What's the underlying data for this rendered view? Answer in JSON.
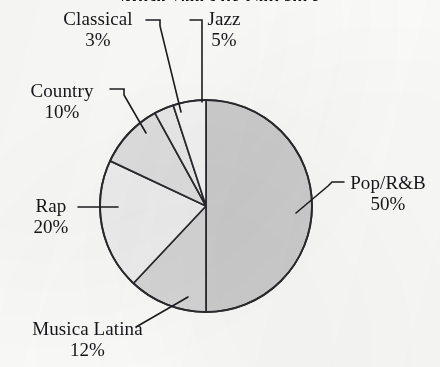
{
  "figure": {
    "title": "Music Sales by Category",
    "title_note": "clipped at top edge of image"
  },
  "chart_data": {
    "type": "pie",
    "title": "Music Sales by Category",
    "xlabel": "",
    "ylabel": "",
    "units": "percent",
    "start_angle_deg": 90,
    "direction": "clockwise",
    "categories": [
      "Pop/R&B",
      "Musica Latina",
      "Rap",
      "Country",
      "Classical",
      "Jazz"
    ],
    "values": [
      50,
      12,
      20,
      10,
      3,
      5
    ],
    "labels": [
      "50%",
      "12%",
      "20%",
      "10%",
      "3%",
      "5%"
    ],
    "slice_colors": [
      "#cfcfcf",
      "#d8d8d8",
      "#f2f2f2",
      "#e2e2e2",
      "#ededed",
      "#f7f7f7"
    ],
    "stroke_color": "#2a2a2e",
    "legend": "none",
    "grid": false,
    "slices": [
      {
        "name": "Pop/R&B",
        "value": 50,
        "label": "50%",
        "color": "#cfcfcf",
        "start_deg": 0,
        "end_deg": 180
      },
      {
        "name": "Musica Latina",
        "value": 12,
        "label": "12%",
        "color": "#d8d8d8",
        "start_deg": 180,
        "end_deg": 223.2
      },
      {
        "name": "Rap",
        "value": 20,
        "label": "20%",
        "color": "#f2f2f2",
        "start_deg": 223.2,
        "end_deg": 295.2
      },
      {
        "name": "Country",
        "value": 10,
        "label": "10%",
        "color": "#e2e2e2",
        "start_deg": 295.2,
        "end_deg": 331.2
      },
      {
        "name": "Classical",
        "value": 3,
        "label": "3%",
        "color": "#ededed",
        "start_deg": 331.2,
        "end_deg": 342.0
      },
      {
        "name": "Jazz",
        "value": 5,
        "label": "5%",
        "color": "#f7f7f7",
        "start_deg": 342.0,
        "end_deg": 360
      }
    ]
  },
  "callouts": {
    "classical": {
      "name": "Classical",
      "percent": "3%"
    },
    "jazz": {
      "name": "Jazz",
      "percent": "5%"
    },
    "country": {
      "name": "Country",
      "percent": "10%"
    },
    "rap": {
      "name": "Rap",
      "percent": "20%"
    },
    "musica": {
      "name": "Musica Latina",
      "percent": "12%"
    },
    "pop": {
      "name": "Pop/R&B",
      "percent": "50%"
    }
  }
}
